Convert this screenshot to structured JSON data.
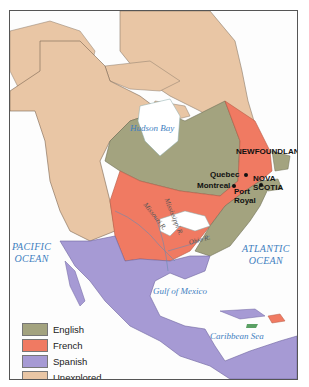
{
  "map": {
    "water_labels": {
      "hudson_bay": "Hudson Bay",
      "pacific_line1": "PACIFIC",
      "pacific_line2": "OCEAN",
      "atlantic_line1": "ATLANTIC",
      "atlantic_line2": "OCEAN",
      "gulf": "Gulf of Mexico",
      "caribbean": "Caribbean Sea"
    },
    "places": {
      "newfoundland": "NEWFOUNDLAND",
      "nova_scotia_line1": "NOVA",
      "nova_scotia_line2": "SCOTIA",
      "quebec": "Quebec",
      "montreal": "Montreal",
      "port_royal_line1": "Port",
      "port_royal_line2": "Royal"
    },
    "rivers": {
      "missouri": "Missouri R.",
      "mississippi": "Mississippi R.",
      "ohio": "Ohio R."
    }
  },
  "legend": {
    "items": [
      {
        "label": "English",
        "color": "#a3a37f"
      },
      {
        "label": "French",
        "color": "#f07a62"
      },
      {
        "label": "Spanish",
        "color": "#a69ad4"
      },
      {
        "label": "Unexplored",
        "color": "#e9c6a5"
      }
    ]
  },
  "colors": {
    "water": "#ffffff",
    "water_label": "#3f7fbf",
    "english": "#a3a37f",
    "french": "#f07a62",
    "spanish": "#a69ad4",
    "unexplored": "#e9c6a5"
  }
}
